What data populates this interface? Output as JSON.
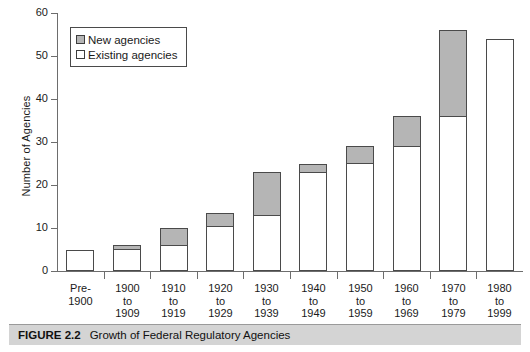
{
  "chart_data": {
    "type": "bar",
    "subtype": "stacked-vertical",
    "title": "Growth of Federal Regulatory Agencies",
    "xlabel": "",
    "ylabel": "Number of Agencies",
    "ylim": [
      0,
      60
    ],
    "ytick_labels": [
      "0",
      "10",
      "20",
      "30",
      "40",
      "50",
      "60"
    ],
    "yticks": [
      0,
      10,
      20,
      30,
      40,
      50,
      60
    ],
    "grid": false,
    "legend_position": "top-left",
    "categories": [
      "Pre-1900",
      "1900 to 1909",
      "1910 to 1919",
      "1920 to 1929",
      "1930 to 1939",
      "1940 to 1949",
      "1950 to 1959",
      "1960 to 1969",
      "1970 to 1979",
      "1980 to 1999"
    ],
    "category_lines": [
      [
        "Pre-",
        "1900"
      ],
      [
        "1900",
        "to",
        "1909"
      ],
      [
        "1910",
        "to",
        "1919"
      ],
      [
        "1920",
        "to",
        "1929"
      ],
      [
        "1930",
        "to",
        "1939"
      ],
      [
        "1940",
        "to",
        "1949"
      ],
      [
        "1950",
        "to",
        "1959"
      ],
      [
        "1960",
        "to",
        "1969"
      ],
      [
        "1970",
        "to",
        "1979"
      ],
      [
        "1980",
        "to",
        "1999"
      ]
    ],
    "series": [
      {
        "name": "Existing agencies",
        "color": "#ffffff",
        "values": [
          5,
          5,
          6,
          10.5,
          13,
          23,
          25,
          29,
          36,
          54
        ]
      },
      {
        "name": "New agencies",
        "color": "#b5b5b5",
        "values": [
          0,
          1,
          4,
          3,
          10,
          2,
          4,
          7,
          20,
          0
        ]
      }
    ],
    "totals": [
      5,
      6,
      10,
      13.5,
      23,
      25,
      29,
      36,
      56,
      54
    ]
  },
  "legend": {
    "items": [
      {
        "label": "New agencies",
        "swatch": "gray"
      },
      {
        "label": "Existing agencies",
        "swatch": "white"
      }
    ]
  },
  "caption": {
    "figure_number": "FIGURE 2.2",
    "title": "Growth of Federal Regulatory Agencies"
  }
}
